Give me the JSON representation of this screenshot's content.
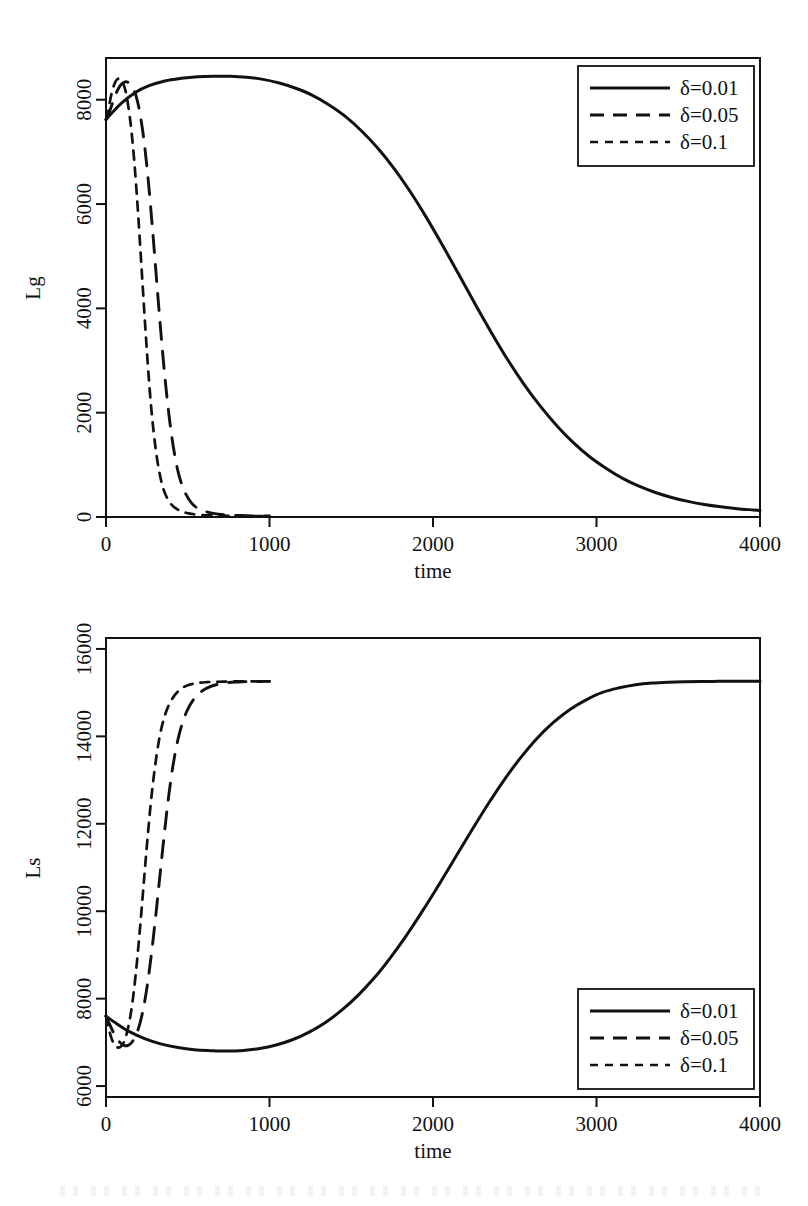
{
  "figure": {
    "panels": [
      "Lg",
      "Ls"
    ],
    "line_color": "#111111",
    "background_color": "#ffffff"
  },
  "legend": {
    "entries": [
      {
        "label": "δ=0.01",
        "style": "solid"
      },
      {
        "label": "δ=0.05",
        "style": "long-dash"
      },
      {
        "label": "δ=0.1",
        "style": "short-dash"
      }
    ],
    "position_top_panel": "top-right",
    "position_bottom_panel": "bottom-right"
  },
  "chart_data": [
    {
      "type": "line",
      "title": "",
      "xlabel": "time",
      "ylabel": "Lg",
      "xlim": [
        0,
        4000
      ],
      "ylim": [
        0,
        8800
      ],
      "xticks": [
        0,
        1000,
        2000,
        3000,
        4000
      ],
      "xticklabels": [
        "0",
        "1000",
        "2000",
        "3000",
        "4000"
      ],
      "yticks": [
        0,
        2000,
        4000,
        6000,
        8000
      ],
      "yticklabels": [
        "0",
        "2000",
        "4000",
        "6000",
        "8000"
      ],
      "grid": false,
      "legend_position": "top-right",
      "series": [
        {
          "name": "δ=0.01",
          "style": "solid",
          "x": [
            0,
            40,
            100,
            180,
            260,
            360,
            460,
            560,
            660,
            760,
            860,
            960,
            1060,
            1160,
            1260,
            1360,
            1460,
            1560,
            1660,
            1760,
            1860,
            1960,
            2060,
            2160,
            2260,
            2360,
            2460,
            2560,
            2660,
            2760,
            2860,
            2960,
            3060,
            3160,
            3260,
            3360,
            3460,
            3560,
            3660,
            3760,
            3860,
            3960,
            4000
          ],
          "y": [
            7620,
            7760,
            7950,
            8140,
            8265,
            8360,
            8410,
            8440,
            8450,
            8450,
            8430,
            8390,
            8320,
            8220,
            8090,
            7910,
            7690,
            7410,
            7080,
            6690,
            6240,
            5740,
            5200,
            4640,
            4070,
            3520,
            3000,
            2530,
            2110,
            1740,
            1420,
            1150,
            930,
            740,
            590,
            470,
            375,
            300,
            240,
            195,
            160,
            135,
            125
          ]
        },
        {
          "name": "δ=0.05",
          "style": "long-dash",
          "x": [
            0,
            20,
            45,
            70,
            95,
            120,
            140,
            160,
            185,
            210,
            235,
            260,
            285,
            310,
            335,
            360,
            385,
            410,
            440,
            475,
            520,
            570,
            640,
            720,
            820,
            920,
            1000
          ],
          "y": [
            7620,
            7760,
            7980,
            8180,
            8300,
            8345,
            8320,
            8240,
            8060,
            7700,
            7150,
            6400,
            5500,
            4520,
            3560,
            2690,
            1960,
            1380,
            880,
            530,
            280,
            150,
            80,
            45,
            28,
            20,
            18
          ]
        },
        {
          "name": "δ=0.1",
          "style": "short-dash",
          "x": [
            0,
            15,
            32,
            50,
            68,
            85,
            100,
            118,
            135,
            155,
            175,
            195,
            215,
            235,
            255,
            275,
            300,
            325,
            355,
            395,
            445,
            505,
            580,
            670,
            760,
            860,
            960,
            1000
          ],
          "y": [
            7620,
            7820,
            8090,
            8290,
            8390,
            8400,
            8340,
            8190,
            7900,
            7420,
            6740,
            5880,
            4900,
            3900,
            2960,
            2150,
            1400,
            880,
            500,
            260,
            130,
            70,
            40,
            27,
            22,
            19,
            18,
            18
          ]
        }
      ]
    },
    {
      "type": "line",
      "title": "",
      "xlabel": "time",
      "ylabel": "Ls",
      "xlim": [
        0,
        4000
      ],
      "ylim": [
        5750,
        16250
      ],
      "xticks": [
        0,
        1000,
        2000,
        3000,
        4000
      ],
      "xticklabels": [
        "0",
        "1000",
        "2000",
        "3000",
        "4000"
      ],
      "yticks": [
        6000,
        8000,
        10000,
        12000,
        14000,
        16000
      ],
      "yticklabels": [
        "6000",
        "8000",
        "10000",
        "12000",
        "14000",
        "16000"
      ],
      "grid": false,
      "legend_position": "bottom-right",
      "series": [
        {
          "name": "δ=0.01",
          "style": "solid",
          "x": [
            0,
            60,
            140,
            240,
            340,
            440,
            540,
            640,
            740,
            840,
            940,
            1040,
            1140,
            1240,
            1340,
            1440,
            1540,
            1640,
            1740,
            1840,
            1940,
            2040,
            2140,
            2240,
            2340,
            2440,
            2540,
            2640,
            2740,
            2840,
            2940,
            3040,
            3140,
            3240,
            3340,
            3440,
            3540,
            3640,
            3740,
            3840,
            3940,
            4000
          ],
          "y": [
            7600,
            7440,
            7250,
            7080,
            6960,
            6880,
            6830,
            6810,
            6800,
            6815,
            6860,
            6940,
            7060,
            7230,
            7450,
            7730,
            8070,
            8470,
            8940,
            9460,
            10030,
            10630,
            11250,
            11870,
            12470,
            13030,
            13530,
            13970,
            14330,
            14620,
            14840,
            15010,
            15110,
            15180,
            15220,
            15240,
            15250,
            15255,
            15258,
            15260,
            15260,
            15260
          ]
        },
        {
          "name": "δ=0.05",
          "style": "long-dash",
          "x": [
            0,
            25,
            55,
            85,
            110,
            135,
            160,
            185,
            210,
            235,
            260,
            285,
            310,
            335,
            360,
            385,
            415,
            450,
            495,
            550,
            620,
            710,
            810,
            910,
            1000
          ],
          "y": [
            7600,
            7390,
            7160,
            7000,
            6930,
            6930,
            7010,
            7180,
            7470,
            7900,
            8500,
            9250,
            10100,
            11000,
            11880,
            12680,
            13450,
            14080,
            14580,
            14910,
            15110,
            15210,
            15245,
            15255,
            15258
          ]
        },
        {
          "name": "δ=0.1",
          "style": "short-dash",
          "x": [
            0,
            15,
            35,
            55,
            75,
            95,
            112,
            130,
            150,
            170,
            190,
            210,
            230,
            250,
            272,
            296,
            325,
            360,
            405,
            460,
            530,
            620,
            720,
            830,
            930,
            1000
          ],
          "y": [
            7600,
            7340,
            7080,
            6930,
            6880,
            6920,
            7030,
            7250,
            7620,
            8160,
            8870,
            9700,
            10600,
            11500,
            12400,
            13200,
            13930,
            14480,
            14860,
            15090,
            15200,
            15240,
            15252,
            15258,
            15260,
            15260
          ]
        }
      ]
    }
  ]
}
